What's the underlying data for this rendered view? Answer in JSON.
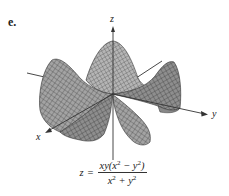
{
  "figure": {
    "label": "e.",
    "axes": {
      "x": "x",
      "y": "y",
      "z": "z"
    },
    "surface_type": "3D mesh surface",
    "colors": {
      "surface_fill": "#9a9a9a",
      "surface_light": "#c4c4c4",
      "mesh": "#333333",
      "axis": "#333333"
    }
  },
  "equation": {
    "lhs": "z",
    "equals": "=",
    "numerator": {
      "prefix": "xy(x",
      "exp1": "2",
      "mid": " − y",
      "exp2": "2",
      "suffix": ")"
    },
    "denominator": {
      "a": "x",
      "exp1": "2",
      "plus": " + y",
      "exp2": "2"
    }
  }
}
